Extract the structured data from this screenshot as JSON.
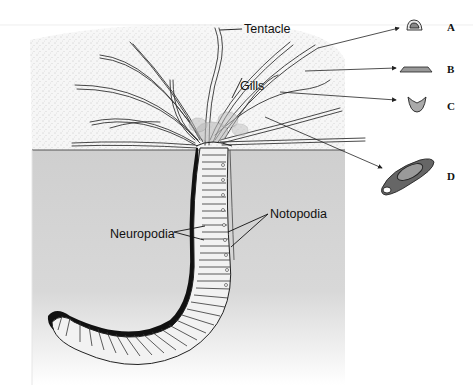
{
  "figure": {
    "labels": {
      "tentacle": "Tentacle",
      "gills": "Gills",
      "notopodia": "Notopodia",
      "neuropodia": "Neuropodia"
    },
    "cross_sections": [
      {
        "letter": "A"
      },
      {
        "letter": "B"
      },
      {
        "letter": "C"
      },
      {
        "letter": "D"
      }
    ],
    "colors": {
      "water": "#f4f4f4",
      "sediment": "#d2d2d2",
      "outline": "#222222",
      "background": "#ffffff"
    }
  }
}
